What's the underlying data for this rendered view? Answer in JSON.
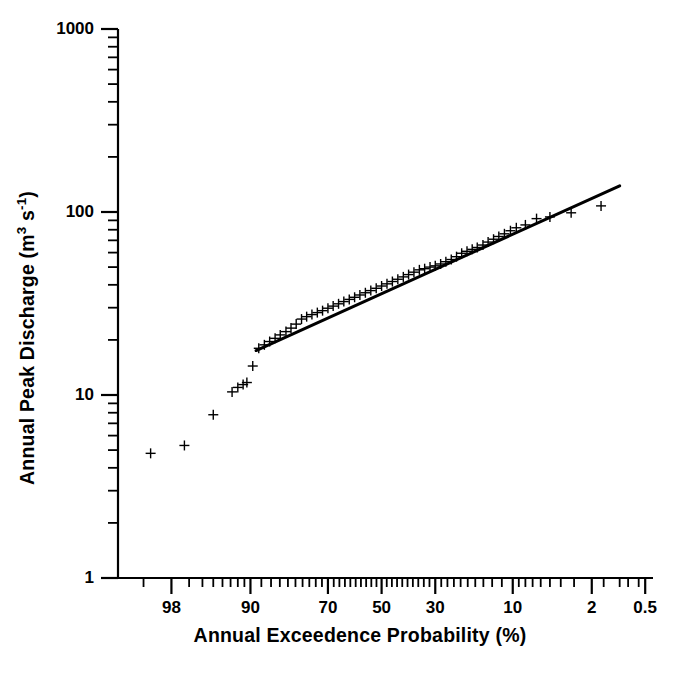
{
  "chart_data": {
    "type": "scatter",
    "title": "",
    "subtitle": "",
    "xlabel": "Annual Exceedence Probability (%)",
    "ylabel": "Annual Peak Discharge (m3 s-1)",
    "ylabel_parts": {
      "prefix": "Annual Peak Discharge (m",
      "sup1": "3",
      "mid": " s",
      "sup2": "-1",
      "suffix": ")"
    },
    "xscale": "probability",
    "yscale": "log",
    "xlim": [
      99.5,
      0.4
    ],
    "ylim": [
      1,
      1000
    ],
    "grid": false,
    "legend": null,
    "x_tick_labels": [
      "98",
      "90",
      "70",
      "50",
      "30",
      "10",
      "2",
      "0.5"
    ],
    "x_tick_values": [
      98,
      90,
      70,
      50,
      30,
      10,
      2,
      0.5
    ],
    "y_tick_labels": [
      "1000",
      "100",
      "10",
      "1"
    ],
    "y_tick_values": [
      1000,
      100,
      10,
      1
    ],
    "marker": "plus",
    "marker_color": "#000000",
    "series": [
      {
        "name": "Annual peak discharge observations",
        "type": "scatter",
        "points": [
          {
            "p": 98.8,
            "q": 4.8
          },
          {
            "p": 97.3,
            "q": 5.3
          },
          {
            "p": 95.0,
            "q": 7.8
          },
          {
            "p": 92.8,
            "q": 10.4
          },
          {
            "p": 92.0,
            "q": 11.0
          },
          {
            "p": 91.2,
            "q": 11.4
          },
          {
            "p": 90.6,
            "q": 11.7
          },
          {
            "p": 89.6,
            "q": 14.4
          },
          {
            "p": 88.5,
            "q": 18.0
          },
          {
            "p": 87.4,
            "q": 18.8
          },
          {
            "p": 86.3,
            "q": 19.6
          },
          {
            "p": 85.1,
            "q": 20.4
          },
          {
            "p": 83.9,
            "q": 21.3
          },
          {
            "p": 82.5,
            "q": 22.2
          },
          {
            "p": 81.2,
            "q": 23.2
          },
          {
            "p": 79.8,
            "q": 24.4
          },
          {
            "p": 78.3,
            "q": 26.0
          },
          {
            "p": 76.8,
            "q": 26.8
          },
          {
            "p": 75.2,
            "q": 27.5
          },
          {
            "p": 73.5,
            "q": 28.2
          },
          {
            "p": 71.8,
            "q": 28.9
          },
          {
            "p": 70.0,
            "q": 29.8
          },
          {
            "p": 68.2,
            "q": 30.6
          },
          {
            "p": 66.3,
            "q": 31.5
          },
          {
            "p": 64.4,
            "q": 32.4
          },
          {
            "p": 62.4,
            "q": 33.3
          },
          {
            "p": 60.4,
            "q": 34.2
          },
          {
            "p": 58.4,
            "q": 35.2
          },
          {
            "p": 56.3,
            "q": 36.2
          },
          {
            "p": 54.2,
            "q": 37.2
          },
          {
            "p": 52.1,
            "q": 38.3
          },
          {
            "p": 50.0,
            "q": 39.4
          },
          {
            "p": 47.9,
            "q": 40.5
          },
          {
            "p": 45.8,
            "q": 41.7
          },
          {
            "p": 43.7,
            "q": 42.9
          },
          {
            "p": 41.6,
            "q": 44.2
          },
          {
            "p": 39.6,
            "q": 45.5
          },
          {
            "p": 37.6,
            "q": 46.9
          },
          {
            "p": 35.6,
            "q": 48.3
          },
          {
            "p": 33.7,
            "q": 49.0
          },
          {
            "p": 31.8,
            "q": 50.0
          },
          {
            "p": 30.0,
            "q": 50.8
          },
          {
            "p": 28.2,
            "q": 52.0
          },
          {
            "p": 26.5,
            "q": 53.5
          },
          {
            "p": 24.8,
            "q": 55.0
          },
          {
            "p": 23.2,
            "q": 57.0
          },
          {
            "p": 21.7,
            "q": 59.5
          },
          {
            "p": 20.2,
            "q": 61.0
          },
          {
            "p": 18.8,
            "q": 62.5
          },
          {
            "p": 17.5,
            "q": 64.0
          },
          {
            "p": 16.1,
            "q": 66.0
          },
          {
            "p": 14.9,
            "q": 68.5
          },
          {
            "p": 13.7,
            "q": 71.0
          },
          {
            "p": 12.6,
            "q": 73.5
          },
          {
            "p": 11.5,
            "q": 76.0
          },
          {
            "p": 10.4,
            "q": 79.0
          },
          {
            "p": 9.4,
            "q": 82.0
          },
          {
            "p": 8.0,
            "q": 85.0
          },
          {
            "p": 6.5,
            "q": 92.0
          },
          {
            "p": 5.0,
            "q": 94.0
          },
          {
            "p": 3.2,
            "q": 99.0
          },
          {
            "p": 1.6,
            "q": 108.0
          }
        ]
      },
      {
        "name": "Fitted frequency distribution",
        "type": "line",
        "color": "#000000",
        "width": 3,
        "endpoints": [
          {
            "p": 89.0,
            "q": 17.5
          },
          {
            "p": 1.0,
            "q": 139.0
          }
        ]
      }
    ]
  },
  "axes": {
    "x_title": "Annual Exceedence Probability (%)",
    "y_title_prefix": "Annual Peak Discharge (m",
    "y_title_sup1": "3",
    "y_title_mid": " s",
    "y_title_sup2": "-1",
    "y_title_suffix": ")"
  }
}
